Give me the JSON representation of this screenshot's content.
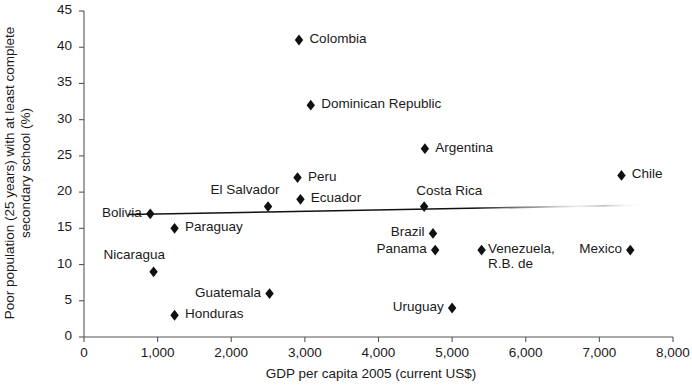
{
  "chart_data": {
    "type": "scatter",
    "title": "",
    "xlabel": "GDP per capita 2005 (current US$)",
    "ylabel": "Poor population (25 years) with at least complete secondary school (%)",
    "xlim": [
      0,
      8000
    ],
    "ylim": [
      0,
      45
    ],
    "xticks": [
      "0",
      "1,000",
      "2,000",
      "3,000",
      "4,000",
      "5,000",
      "6,000",
      "7,000",
      "8,000"
    ],
    "xtick_values": [
      0,
      1000,
      2000,
      3000,
      4000,
      5000,
      6000,
      7000,
      8000
    ],
    "yticks": [
      "0",
      "5",
      "10",
      "15",
      "20",
      "25",
      "30",
      "35",
      "40",
      "45"
    ],
    "ytick_values": [
      0,
      5,
      10,
      15,
      20,
      25,
      30,
      35,
      40,
      45
    ],
    "grid": false,
    "legend": "none",
    "marker": "diamond",
    "marker_color": "#111111",
    "points": [
      {
        "label": "Bolivia",
        "x": 900,
        "y": 17.0,
        "label_pos": "left"
      },
      {
        "label": "Nicaragua",
        "x": 945,
        "y": 9.0,
        "label_pos": "above-left"
      },
      {
        "label": "Paraguay",
        "x": 1230,
        "y": 15.0,
        "label_pos": "right"
      },
      {
        "label": "Honduras",
        "x": 1230,
        "y": 3.0,
        "label_pos": "right"
      },
      {
        "label": "El Salvador",
        "x": 2500,
        "y": 18.0,
        "label_pos": "above-left"
      },
      {
        "label": "Guatemala",
        "x": 2520,
        "y": 6.0,
        "label_pos": "left"
      },
      {
        "label": "Colombia",
        "x": 2920,
        "y": 41.0,
        "label_pos": "right"
      },
      {
        "label": "Peru",
        "x": 2900,
        "y": 22.0,
        "label_pos": "right"
      },
      {
        "label": "Ecuador",
        "x": 2940,
        "y": 19.0,
        "label_pos": "right"
      },
      {
        "label": "Dominican Republic",
        "x": 3080,
        "y": 32.0,
        "label_pos": "right"
      },
      {
        "label": "Costa Rica",
        "x": 4620,
        "y": 18.0,
        "label_pos": "above-right"
      },
      {
        "label": "Argentina",
        "x": 4630,
        "y": 26.0,
        "label_pos": "right"
      },
      {
        "label": "Brazil",
        "x": 4740,
        "y": 14.3,
        "label_pos": "left"
      },
      {
        "label": "Panama",
        "x": 4770,
        "y": 12.0,
        "label_pos": "left"
      },
      {
        "label": "Uruguay",
        "x": 5000,
        "y": 4.0,
        "label_pos": "left"
      },
      {
        "label": "Venezuela,\nR.B. de",
        "x": 5400,
        "y": 12.0,
        "label_pos": "right-twoline"
      },
      {
        "label": "Chile",
        "x": 7300,
        "y": 22.3,
        "label_pos": "right"
      },
      {
        "label": "Mexico",
        "x": 7420,
        "y": 12.0,
        "label_pos": "left"
      }
    ],
    "trendline": {
      "name": "linear fit",
      "x_start": 600,
      "y_start": 16.9,
      "x_end": 7550,
      "y_end": 18.2,
      "fades_right": true
    }
  }
}
